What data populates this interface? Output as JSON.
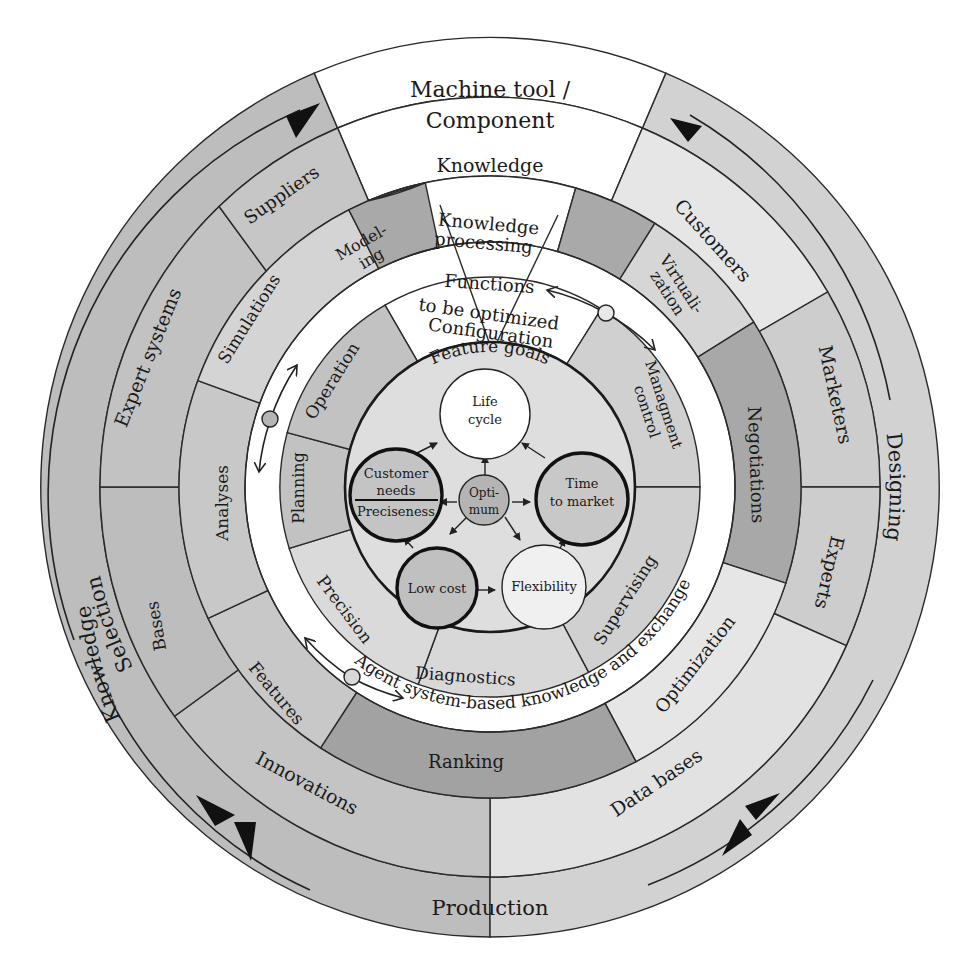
{
  "colors": {
    "white": "#ffffff",
    "light": "#e4e4e4",
    "mid": "#cfcfcf",
    "gray": "#bdbdbd",
    "dark": "#a6a6a6",
    "darker": "#9a9a9a",
    "line": "#2a2a2a"
  },
  "outer_ring": {
    "top": {
      "line1": "Machine tool /",
      "line2": "Component"
    },
    "left_labels": {
      "selection": "Selection",
      "knowledge": "Knowledge"
    },
    "right_label": "Designing",
    "bottom_label": "Production"
  },
  "ring2": {
    "knowledge": "Knowledge",
    "customers": "Customers",
    "marketers": "Marketers",
    "experts": "Experts",
    "data_bases": "Data bases",
    "innovations": "Innovations",
    "bases": "Bases",
    "expert_systems": "Expert systems",
    "suppliers": "Suppliers"
  },
  "ring3": {
    "knowledge_processing": {
      "line1": "Knowledge",
      "line2": "processing"
    },
    "virtualization": {
      "line1": "Virtuali-",
      "line2": "zation"
    },
    "negotiations": "Negotiations",
    "optimization": "Optimization",
    "ranking": "Ranking",
    "features": "Features",
    "analyses": "Analyses",
    "simulations": "Simulations",
    "modeling": {
      "line1": "Model-",
      "line2": "ing"
    }
  },
  "white_band": {
    "functions": "Functions",
    "to_be_optimized": "to be optimized",
    "agent_label": "Agent system-based knowledge and exchange"
  },
  "ring4": {
    "configuration": "Configuration",
    "management_control": {
      "line1": "Managment",
      "line2": "control"
    },
    "supervising": "Supervising",
    "diagnostics": "Diagnostics",
    "precision": "Precision",
    "planning": "Planning",
    "operation": "Operation"
  },
  "core": {
    "feature_goals": "Feature goals",
    "life_cycle": {
      "line1": "Life",
      "line2": "cycle"
    },
    "customer_needs": {
      "line1": "Customer",
      "line2": "needs",
      "line3": "Preciseness"
    },
    "optimum": {
      "line1": "Opti-",
      "line2": "mum"
    },
    "time_to_market": {
      "line1": "Time",
      "line2": "to market"
    },
    "low_cost": "Low cost",
    "flexibility": "Flexibility"
  }
}
